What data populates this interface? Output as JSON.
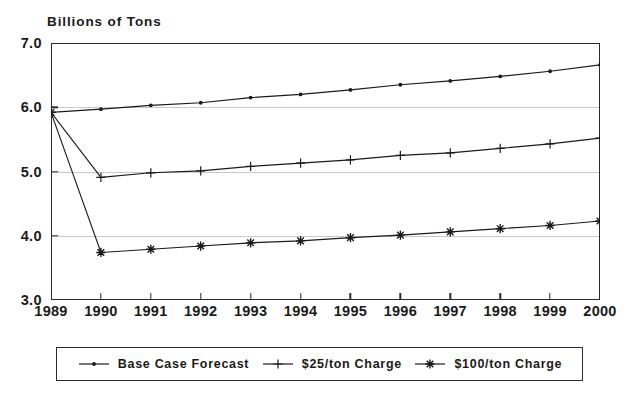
{
  "chart_data": {
    "type": "line",
    "title": "",
    "ylabel": "Billions of Tons",
    "xlabel": "",
    "ylim": [
      3.0,
      7.0
    ],
    "yticks": [
      "3.0",
      "4.0",
      "5.0",
      "6.0",
      "7.0"
    ],
    "ytick_values": [
      3.0,
      4.0,
      5.0,
      6.0,
      7.0
    ],
    "gridlines": [
      4.0,
      5.0,
      6.0
    ],
    "grid": true,
    "legend_position": "below-axes",
    "categories": [
      "1989",
      "1990",
      "1991",
      "1992",
      "1993",
      "1994",
      "1995",
      "1996",
      "1997",
      "1998",
      "1999",
      "2000"
    ],
    "x": [
      1989,
      1990,
      1991,
      1992,
      1993,
      1994,
      1995,
      1996,
      1997,
      1998,
      1999,
      2000
    ],
    "series": [
      {
        "name": "Base Case Forecast",
        "marker": "dot",
        "color": "#1a1a1a",
        "values": [
          5.92,
          5.97,
          6.03,
          6.07,
          6.15,
          6.2,
          6.27,
          6.35,
          6.41,
          6.48,
          6.56,
          6.66
        ]
      },
      {
        "name": "$25/ton Charge",
        "marker": "plus",
        "color": "#1a1a1a",
        "values": [
          5.92,
          4.91,
          4.98,
          5.01,
          5.08,
          5.13,
          5.18,
          5.25,
          5.29,
          5.36,
          5.43,
          5.52
        ]
      },
      {
        "name": "$100/ton Charge",
        "marker": "asterisk",
        "color": "#1a1a1a",
        "values": [
          5.92,
          3.74,
          3.79,
          3.84,
          3.89,
          3.92,
          3.97,
          4.01,
          4.06,
          4.11,
          4.16,
          4.23
        ]
      }
    ]
  },
  "axis": {
    "y_title": "Billions of Tons"
  },
  "legend": {
    "entries": [
      {
        "label": "Base Case Forecast",
        "marker": "dot-marker"
      },
      {
        "label": "$25/ton Charge",
        "marker": "plus-marker"
      },
      {
        "label": "$100/ton Charge",
        "marker": "asterisk-marker"
      }
    ]
  }
}
